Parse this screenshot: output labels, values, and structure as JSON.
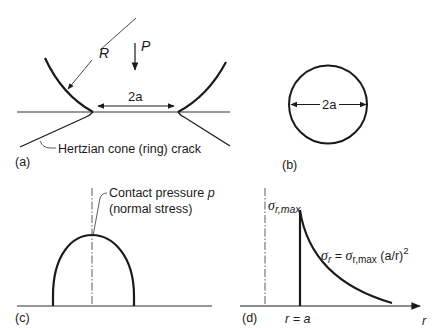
{
  "figure": {
    "panels": {
      "a": {
        "label": "(a)",
        "radius_label": "R",
        "load_label": "P",
        "contact_width_label": "2a",
        "crack_label": "Hertzian cone (ring) crack"
      },
      "b": {
        "label": "(b)",
        "diameter_label": "2a"
      },
      "c": {
        "label": "(c)",
        "pressure_label_line1": "Contact pressure p",
        "pressure_label_line1_text": "Contact pressure ",
        "pressure_symbol": "p",
        "pressure_label_line2": "(normal stress)"
      },
      "d": {
        "label": "(d)",
        "max_stress_symbol": "σ",
        "max_stress_subscript": "r,max",
        "equation_lhs_symbol": "σ",
        "equation_lhs_subscript": "r",
        "equation_eq": " = ",
        "equation_rhs_symbol": "σ",
        "equation_rhs_subscript": "r,max",
        "equation_rhs_tail": " (a/r)",
        "equation_exponent": "2",
        "x_marker_label": "r = a",
        "x_axis_label": "r"
      }
    },
    "colors": {
      "ink": "#1a1a1a",
      "thin_ink": "#333333",
      "background": "#ffffff"
    }
  }
}
